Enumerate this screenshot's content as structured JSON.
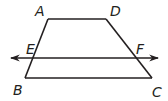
{
  "figure": {
    "type": "trapezoid-with-transversal-line",
    "stroke_color": "#231f20",
    "background": "#ffffff",
    "points": {
      "A": {
        "x": 48,
        "y": 19
      },
      "D": {
        "x": 106,
        "y": 19
      },
      "B": {
        "x": 25,
        "y": 78
      },
      "C": {
        "x": 152,
        "y": 78
      },
      "E": {
        "x": 33,
        "y": 58
      },
      "F": {
        "x": 135,
        "y": 58
      }
    },
    "labels": {
      "A": "A",
      "B": "B",
      "C": "C",
      "D": "D",
      "E": "E",
      "F": "F"
    },
    "segments": [
      "AD",
      "AB",
      "DC",
      "BC"
    ],
    "line": {
      "name": "EF",
      "from_x": 10,
      "to_x": 158,
      "y": 58,
      "arrows": "both"
    }
  }
}
